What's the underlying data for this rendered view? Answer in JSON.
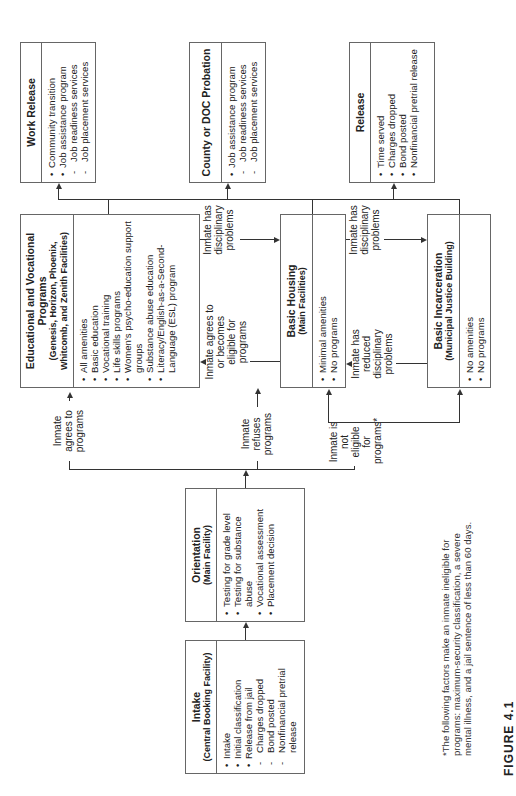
{
  "boxes": {
    "intake": {
      "title": "Intake",
      "subtitle": "(Central Booking Facility)",
      "items": [
        {
          "type": "bullet",
          "text": "Intake"
        },
        {
          "type": "bullet",
          "text": "Initial classification"
        },
        {
          "type": "bullet",
          "text": "Release from jail"
        },
        {
          "type": "dash",
          "text": "Charges dropped"
        },
        {
          "type": "dash",
          "text": "Bond posted"
        },
        {
          "type": "dash",
          "text": "Nonfinancial pretrial release"
        }
      ]
    },
    "orientation": {
      "title": "Orientation",
      "subtitle": "(Main Facility)",
      "items": [
        {
          "type": "bullet",
          "text": "Testing for grade level"
        },
        {
          "type": "bullet",
          "text": "Testing for substance abuse"
        },
        {
          "type": "bullet",
          "text": "Vocational assessment"
        },
        {
          "type": "bullet",
          "text": "Placement decision"
        }
      ]
    },
    "educational": {
      "title": "Educational and Vocational Programs",
      "subtitle": "(Genesis, Horizon, Phoenix, Whitcomb, and Zenith Facilities)",
      "items": [
        {
          "type": "bullet",
          "text": "All amenities"
        },
        {
          "type": "bullet",
          "text": "Basic education"
        },
        {
          "type": "bullet",
          "text": "Vocational training"
        },
        {
          "type": "bullet",
          "text": "Life skills programs"
        },
        {
          "type": "bullet",
          "text": "Women's psycho-education support groups"
        },
        {
          "type": "bullet",
          "text": "Substance abuse education"
        },
        {
          "type": "bullet",
          "text": "Literacy/English-as-a-Second-Language (ESL) program"
        }
      ]
    },
    "basic_housing": {
      "title": "Basic Housing",
      "subtitle": "(Main Facilities)",
      "items": [
        {
          "type": "bullet",
          "text": "Minimal amenities"
        },
        {
          "type": "bullet",
          "text": "No programs"
        }
      ]
    },
    "basic_incarceration": {
      "title": "Basic Incarceration",
      "subtitle": "(Municipal Justice Building)",
      "items": [
        {
          "type": "bullet",
          "text": "No amenities"
        },
        {
          "type": "bullet",
          "text": "No programs"
        }
      ]
    },
    "work_release": {
      "title": "Work Release",
      "subtitle": "",
      "items": [
        {
          "type": "bullet",
          "text": "Community transition"
        },
        {
          "type": "bullet",
          "text": "Job assistance program"
        },
        {
          "type": "dash",
          "text": "Job readiness services"
        },
        {
          "type": "dash",
          "text": "Job placement services"
        }
      ]
    },
    "probation": {
      "title": "County or DOC Probation",
      "subtitle": "",
      "items": [
        {
          "type": "bullet",
          "text": "Job assistance program"
        },
        {
          "type": "dash",
          "text": "Job readiness services"
        },
        {
          "type": "dash",
          "text": "Job placement services"
        }
      ]
    },
    "release": {
      "title": "Release",
      "subtitle": "",
      "items": [
        {
          "type": "bullet",
          "text": "Time served"
        },
        {
          "type": "bullet",
          "text": "Charges dropped"
        },
        {
          "type": "bullet",
          "text": "Bond posted"
        },
        {
          "type": "bullet",
          "text": "Nonfinancial pretrial release"
        }
      ]
    }
  },
  "edges": {
    "agrees": "Inmate agrees to programs",
    "refuses": "Inmate refuses programs",
    "not_eligible": "Inmate is not eligible for programs*",
    "edu_to_housing": "Inmate has disciplinary problems",
    "housing_to_edu": "Inmate agrees to or becomes eligible for programs",
    "housing_to_incarc": "Inmate has disciplinary problems",
    "incarc_to_housing": "Inmate has reduced disciplinary problems"
  },
  "footnote": "*The following factors make an inmate ineligible for programs: maximum-security classification, a severe mental illness, and a jail sentence of less than 60 days.",
  "figure_label": "FIGURE 4.1"
}
